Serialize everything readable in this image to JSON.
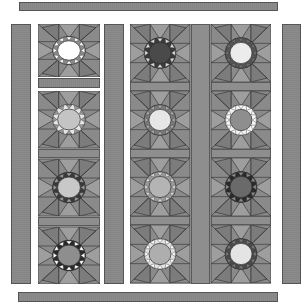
{
  "diagram": {
    "title": "",
    "type": "quilt-layout",
    "colors": {
      "background": "#ffffff",
      "strip": "#8c8c8c",
      "block_bg": "#8a8a8a",
      "line": "#2e2e2e"
    },
    "borders": {
      "top": {
        "x": 19,
        "y": 2,
        "w": 259,
        "h": 9
      },
      "bottom": {
        "x": 18,
        "y": 292,
        "w": 260,
        "h": 10
      },
      "left": {
        "x": 11,
        "y": 24,
        "w": 20,
        "h": 260
      },
      "middle": {
        "x": 104,
        "y": 24,
        "w": 20,
        "h": 260
      },
      "right": {
        "x": 282,
        "y": 24,
        "w": 19,
        "h": 260
      }
    },
    "column1": {
      "x": 38,
      "w": 62,
      "top_block": {
        "y": 24,
        "h": 53,
        "center": "#ffffff",
        "ring": "#8a8a8a",
        "points": "#ffffff"
      },
      "sash": {
        "y": 78,
        "h": 10
      },
      "lower_panel": {
        "y": 91,
        "h": 193
      },
      "blocks": [
        {
          "center": "#c4c4c4",
          "ring": "#e6e6e6",
          "points": "#9c9c9c"
        },
        {
          "center": "#c8c8c8",
          "ring": "#3a3a3a",
          "points": "#9c9c9c"
        },
        {
          "center": "#8e8e8e",
          "ring": "#2a2a2a",
          "points": "#ffffff"
        }
      ]
    },
    "right_panel": {
      "x": 130,
      "y": 24,
      "w": 141,
      "h": 260,
      "center_sash_x": 191,
      "center_sash_w": 19,
      "columns": [
        [
          {
            "center": "#4a4a4a",
            "ring": "#3a3a3a",
            "points": "#dcdcdc"
          },
          {
            "center": "#e6e6e6",
            "ring": "#7a7a7a",
            "points": "#a8a8a8"
          },
          {
            "center": "#b4b4b4",
            "ring": "#9a9a9a",
            "points": "#d6d6d6"
          },
          {
            "center": "#aeaeae",
            "ring": "#e2e2e2",
            "points": "#ffffff"
          }
        ],
        [
          {
            "center": "#ececec",
            "ring": "#555555",
            "points": "#6e6e6e"
          },
          {
            "center": "#8e8e8e",
            "ring": "#f2f2f2",
            "points": "#ffffff"
          },
          {
            "center": "#6a6a6a",
            "ring": "#2a2a2a",
            "points": "#8a8a8a"
          },
          {
            "center": "#e4e4e4",
            "ring": "#4a4a4a",
            "points": "#777777"
          }
        ]
      ]
    }
  }
}
